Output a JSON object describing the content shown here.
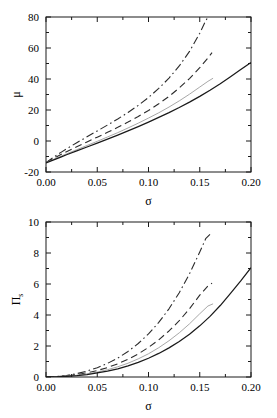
{
  "figure": {
    "background": "#ffffff",
    "foreground": "#1a1a1a",
    "panel_count": 2
  },
  "chart_data": [
    {
      "id": "panel-top",
      "type": "line",
      "title": "",
      "xlabel": "σ",
      "ylabel": "μ",
      "ylabel_sub": "",
      "xlim": [
        0.0,
        0.2
      ],
      "ylim": [
        -20,
        80
      ],
      "xticks": [
        0.0,
        0.05,
        0.1,
        0.15,
        0.2
      ],
      "xticklabels": [
        "0.00",
        "0.05",
        "0.10",
        "0.15",
        "0.20"
      ],
      "yticks": [
        -20,
        0,
        20,
        40,
        60,
        80
      ],
      "yticklabels": [
        "-20",
        "0",
        "20",
        "40",
        "60",
        "80"
      ],
      "xminor": [
        0.025,
        0.075,
        0.125,
        0.175
      ],
      "yminor": [
        -10,
        10,
        30,
        50,
        70
      ],
      "grid": false,
      "legend": "none",
      "series": [
        {
          "name": "dash-dot",
          "style": "dashdot",
          "color": "#2b2b2b",
          "width": 1.1,
          "x": [
            0.0,
            0.005,
            0.01,
            0.015,
            0.02,
            0.03,
            0.04,
            0.05,
            0.06,
            0.07,
            0.08,
            0.09,
            0.1,
            0.11,
            0.12,
            0.13,
            0.14,
            0.15,
            0.155,
            0.158
          ],
          "y": [
            -14.0,
            -11.6,
            -9.3,
            -7.2,
            -5.1,
            -1.1,
            2.7,
            6.5,
            10.3,
            14.2,
            18.4,
            23.0,
            28.1,
            33.9,
            40.6,
            48.4,
            57.8,
            69.5,
            76.5,
            80.0
          ]
        },
        {
          "name": "dashed",
          "style": "dashed",
          "color": "#2b2b2b",
          "width": 1.1,
          "x": [
            0.0,
            0.005,
            0.01,
            0.015,
            0.02,
            0.03,
            0.04,
            0.05,
            0.06,
            0.07,
            0.08,
            0.09,
            0.1,
            0.11,
            0.12,
            0.13,
            0.14,
            0.15,
            0.158,
            0.162
          ],
          "y": [
            -14.0,
            -12.1,
            -10.3,
            -8.6,
            -6.9,
            -3.7,
            -0.6,
            2.5,
            5.6,
            8.8,
            12.2,
            15.8,
            19.7,
            24.0,
            28.8,
            34.2,
            40.3,
            47.3,
            53.6,
            57.0
          ]
        },
        {
          "name": "light-solid",
          "style": "solid",
          "color": "#a8a8a8",
          "width": 1.0,
          "x": [
            0.0,
            0.005,
            0.01,
            0.015,
            0.02,
            0.03,
            0.04,
            0.05,
            0.06,
            0.07,
            0.08,
            0.09,
            0.1,
            0.11,
            0.12,
            0.13,
            0.14,
            0.15,
            0.158,
            0.163
          ],
          "y": [
            -14.0,
            -12.5,
            -11.1,
            -9.7,
            -8.3,
            -5.6,
            -2.9,
            -0.2,
            2.6,
            5.4,
            8.4,
            11.5,
            14.8,
            18.2,
            21.9,
            25.9,
            30.2,
            34.8,
            38.5,
            40.5
          ]
        },
        {
          "name": "solid",
          "style": "solid",
          "color": "#1a1a1a",
          "width": 1.25,
          "x": [
            0.0,
            0.005,
            0.01,
            0.015,
            0.02,
            0.03,
            0.04,
            0.05,
            0.06,
            0.07,
            0.08,
            0.09,
            0.1,
            0.11,
            0.12,
            0.13,
            0.14,
            0.15,
            0.16,
            0.17,
            0.18,
            0.19,
            0.2
          ],
          "y": [
            -14.2,
            -12.8,
            -11.5,
            -10.2,
            -8.9,
            -6.4,
            -3.9,
            -1.4,
            1.2,
            3.8,
            6.5,
            9.3,
            12.2,
            15.2,
            18.3,
            21.6,
            25.1,
            28.8,
            32.7,
            36.9,
            41.4,
            46.1,
            50.6
          ]
        }
      ]
    },
    {
      "id": "panel-bot",
      "type": "line",
      "title": "",
      "xlabel": "σ",
      "ylabel": "Π",
      "ylabel_sub": "s",
      "xlim": [
        0.0,
        0.2
      ],
      "ylim": [
        0,
        10
      ],
      "xticks": [
        0.0,
        0.05,
        0.1,
        0.15,
        0.2
      ],
      "xticklabels": [
        "0.00",
        "0.05",
        "0.10",
        "0.15",
        "0.20"
      ],
      "yticks": [
        0,
        2,
        4,
        6,
        8,
        10
      ],
      "yticklabels": [
        "0",
        "2",
        "4",
        "6",
        "8",
        "10"
      ],
      "xminor": [
        0.025,
        0.075,
        0.125,
        0.175
      ],
      "yminor": [
        1,
        3,
        5,
        7,
        9
      ],
      "grid": false,
      "legend": "none",
      "series": [
        {
          "name": "dash-dot",
          "style": "dashdot",
          "color": "#2b2b2b",
          "width": 1.1,
          "x": [
            0.0,
            0.01,
            0.02,
            0.03,
            0.04,
            0.05,
            0.06,
            0.07,
            0.08,
            0.09,
            0.1,
            0.11,
            0.12,
            0.13,
            0.14,
            0.15,
            0.156,
            0.16
          ],
          "y": [
            0.0,
            0.03,
            0.1,
            0.22,
            0.38,
            0.6,
            0.88,
            1.22,
            1.65,
            2.16,
            2.78,
            3.52,
            4.4,
            5.44,
            6.66,
            8.06,
            8.95,
            9.2
          ]
        },
        {
          "name": "dashed",
          "style": "dashed",
          "color": "#2b2b2b",
          "width": 1.1,
          "x": [
            0.0,
            0.01,
            0.02,
            0.03,
            0.04,
            0.05,
            0.06,
            0.07,
            0.08,
            0.09,
            0.1,
            0.11,
            0.12,
            0.13,
            0.14,
            0.15,
            0.158,
            0.162
          ],
          "y": [
            0.0,
            0.02,
            0.07,
            0.15,
            0.27,
            0.42,
            0.61,
            0.85,
            1.14,
            1.49,
            1.91,
            2.4,
            2.97,
            3.63,
            4.4,
            5.28,
            5.88,
            6.05
          ]
        },
        {
          "name": "light-solid",
          "style": "solid",
          "color": "#a8a8a8",
          "width": 1.0,
          "x": [
            0.0,
            0.01,
            0.02,
            0.03,
            0.04,
            0.05,
            0.06,
            0.07,
            0.08,
            0.09,
            0.1,
            0.11,
            0.12,
            0.13,
            0.14,
            0.15,
            0.158,
            0.163
          ],
          "y": [
            0.0,
            0.01,
            0.05,
            0.11,
            0.2,
            0.32,
            0.47,
            0.66,
            0.89,
            1.17,
            1.5,
            1.89,
            2.34,
            2.85,
            3.43,
            4.08,
            4.58,
            4.72
          ]
        },
        {
          "name": "solid",
          "style": "solid",
          "color": "#1a1a1a",
          "width": 1.25,
          "x": [
            0.0,
            0.01,
            0.02,
            0.03,
            0.04,
            0.05,
            0.06,
            0.07,
            0.08,
            0.09,
            0.1,
            0.11,
            0.12,
            0.13,
            0.14,
            0.15,
            0.16,
            0.17,
            0.18,
            0.19,
            0.2
          ],
          "y": [
            0.0,
            0.01,
            0.04,
            0.09,
            0.16,
            0.26,
            0.38,
            0.53,
            0.72,
            0.94,
            1.21,
            1.52,
            1.88,
            2.29,
            2.76,
            3.3,
            3.91,
            4.61,
            5.4,
            6.2,
            7.05
          ]
        }
      ]
    }
  ]
}
